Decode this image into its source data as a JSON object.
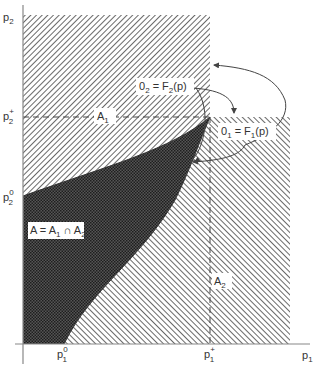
{
  "axes": {
    "x_label": "p",
    "x_label_sub": "1",
    "y_label": "p",
    "y_label_sub": "2"
  },
  "ticks": {
    "p1_0": {
      "base": "p",
      "sub": "1",
      "sup": "0"
    },
    "p1_plus": {
      "base": "p",
      "sub": "1",
      "sup": "+"
    },
    "p2_0": {
      "base": "p",
      "sub": "2",
      "sup": "0"
    },
    "p2_plus": {
      "base": "p",
      "sub": "2",
      "sup": "+"
    }
  },
  "regions": {
    "A1": {
      "base": "A",
      "sub": "1"
    },
    "A2": {
      "base": "A",
      "sub": "2"
    },
    "A": {
      "text_a": "A = A",
      "sub1": "1",
      "cap": " ∩ A",
      "sub2": "2"
    }
  },
  "functions": {
    "O2": {
      "lhs": "0",
      "lhs_sub": "2",
      "eq": " = F",
      "rhs_sub": "2",
      "arg": "(p)"
    },
    "O1": {
      "lhs": "0",
      "lhs_sub": "1",
      "eq": " = F",
      "rhs_sub": "1",
      "arg": "(p)"
    }
  },
  "colors": {
    "hatch": "#6a6a6a",
    "dense": "#2e2e2e",
    "line": "#444444",
    "background": "#ffffff"
  }
}
